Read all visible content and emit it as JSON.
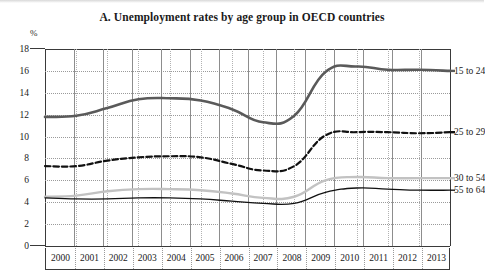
{
  "figure": {
    "title": "A. Unemployment rates by age group in OECD countries",
    "unit": "%"
  },
  "chart_data": {
    "type": "line",
    "title": "A. Unemployment rates by age group in OECD countries",
    "xlabel": "",
    "ylabel": "%",
    "ylim": [
      0,
      18
    ],
    "ytick_step": 2,
    "yticks": [
      "18",
      "16",
      "14",
      "12",
      "10",
      "8",
      "6",
      "4",
      "2",
      "0"
    ],
    "grid": true,
    "legend_position": "right-inline",
    "x": [
      "2000",
      "2001",
      "2002",
      "2003",
      "2004",
      "2005",
      "2006",
      "2007",
      "2008",
      "2009",
      "2010",
      "2011",
      "2012",
      "2013"
    ],
    "series": [
      {
        "name": "15 to 24",
        "color": "#5a5a5a",
        "style": "solid-thick",
        "values": [
          11.8,
          11.9,
          12.6,
          13.4,
          13.5,
          13.3,
          12.5,
          11.3,
          11.9,
          15.9,
          16.4,
          16.1,
          16.1,
          16.0
        ]
      },
      {
        "name": "25 to 29",
        "color": "#111111",
        "style": "dashed",
        "values": [
          7.3,
          7.3,
          7.8,
          8.1,
          8.2,
          8.1,
          7.5,
          6.9,
          7.3,
          10.1,
          10.4,
          10.4,
          10.3,
          10.4
        ]
      },
      {
        "name": "30 to 54",
        "color": "#c2c2c2",
        "style": "solid-light",
        "values": [
          4.5,
          4.6,
          5.0,
          5.2,
          5.2,
          5.1,
          4.8,
          4.4,
          4.5,
          6.0,
          6.3,
          6.2,
          6.2,
          6.2
        ]
      },
      {
        "name": "55 to 64",
        "color": "#111111",
        "style": "solid-thin",
        "values": [
          4.4,
          4.3,
          4.3,
          4.4,
          4.4,
          4.3,
          4.1,
          3.9,
          3.9,
          4.9,
          5.3,
          5.2,
          5.1,
          5.1
        ]
      }
    ]
  }
}
